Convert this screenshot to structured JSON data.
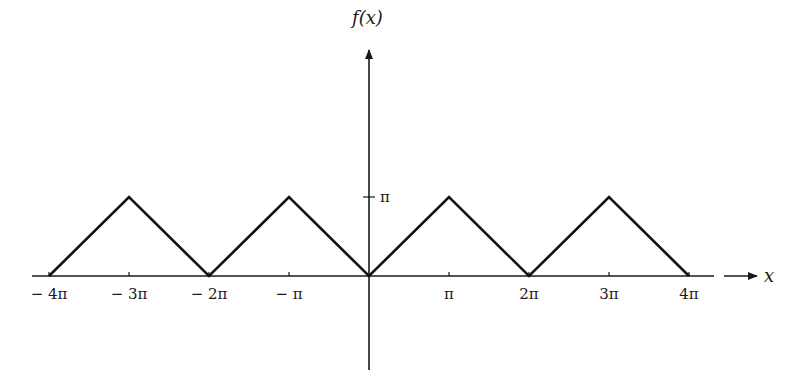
{
  "chart_data": {
    "type": "line",
    "title": "",
    "xlabel": "x",
    "ylabel": "f(x)",
    "x_unit": "π",
    "xlim": [
      -4,
      4
    ],
    "ylim": [
      0,
      1
    ],
    "x_ticks": [
      {
        "value": -4,
        "label": "− 4π"
      },
      {
        "value": -3,
        "label": "− 3π"
      },
      {
        "value": -2,
        "label": "− 2π"
      },
      {
        "value": -1,
        "label": "− π"
      },
      {
        "value": 1,
        "label": "π"
      },
      {
        "value": 2,
        "label": "2π"
      },
      {
        "value": 3,
        "label": "3π"
      },
      {
        "value": 4,
        "label": "4π"
      }
    ],
    "y_ticks": [
      {
        "value": 1,
        "label": "π"
      }
    ],
    "series": [
      {
        "name": "f(x)",
        "x": [
          -4,
          -3,
          -2,
          -1,
          0,
          1,
          2,
          3,
          4
        ],
        "y": [
          0,
          1,
          0,
          1,
          0,
          1,
          0,
          1,
          0
        ]
      }
    ],
    "grid": false,
    "legend": "none"
  }
}
